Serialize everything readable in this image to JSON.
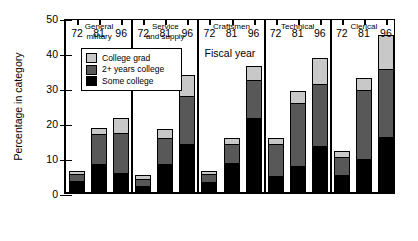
{
  "chart_data": {
    "type": "bar",
    "stacked": true,
    "title": "",
    "xlabel": "Fiscal year",
    "ylabel": "Percentage in category",
    "ylim": [
      0,
      50
    ],
    "yticks": [
      0,
      10,
      20,
      30,
      40,
      50
    ],
    "grid": false,
    "legend_position": "upper-left-inside",
    "legend": [
      "College grad",
      "2+ years college",
      "Some college"
    ],
    "series": [
      {
        "name": "Some college",
        "color": "#000000",
        "values": [
          3.1,
          8.1,
          5.4,
          1.7,
          7.9,
          13.7,
          3.0,
          8.3,
          21.1,
          4.4,
          7.3,
          13.1,
          4.7,
          9.4,
          15.7
        ]
      },
      {
        "name": "2+ years college",
        "color": "#585858",
        "values": [
          2.1,
          8.6,
          11.6,
          2.1,
          7.7,
          14.0,
          2.4,
          5.7,
          11.2,
          9.4,
          18.3,
          18.0,
          5.4,
          20.0,
          19.7
        ]
      },
      {
        "name": "College grad",
        "color": "#c8c8c8",
        "values": [
          0.9,
          1.6,
          4.1,
          1.0,
          2.4,
          5.7,
          0.6,
          1.4,
          3.7,
          1.6,
          3.3,
          7.2,
          1.6,
          3.3,
          9.5
        ]
      }
    ],
    "groups": [
      {
        "label": "General\nmilitary",
        "categories": [
          "72",
          "81",
          "96"
        ],
        "totals": [
          6.1,
          18.3,
          21.1
        ]
      },
      {
        "label": "Service\nand supply",
        "categories": [
          "72",
          "81",
          "96"
        ],
        "totals": [
          4.8,
          18.0,
          33.4
        ]
      },
      {
        "label": "Craftsmen",
        "categories": [
          "72",
          "81",
          "96"
        ],
        "totals": [
          6.0,
          15.4,
          36.0
        ]
      },
      {
        "label": "Technical",
        "categories": [
          "72",
          "81",
          "96"
        ],
        "totals": [
          15.4,
          28.9,
          38.3
        ]
      },
      {
        "label": "Clerical",
        "categories": [
          "72",
          "81",
          "96"
        ],
        "totals": [
          11.7,
          32.7,
          44.9
        ]
      }
    ]
  }
}
